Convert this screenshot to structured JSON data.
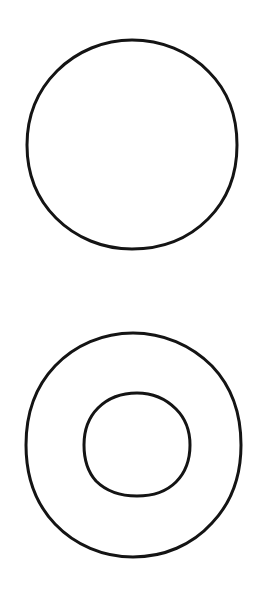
{
  "figure": {
    "kind": "line-drawing",
    "background_color": "#ffffff",
    "ink_color": "#141414",
    "canvas": {
      "width": 268,
      "height": 592
    },
    "shapes": [
      {
        "id": "top-circle",
        "name": "circle",
        "description": "Single hand-drawn circle outline, upper half of the page",
        "center_x": 132,
        "center_y": 145,
        "radius_x": 105,
        "radius_y": 105,
        "bounds": {
          "left": 27,
          "top": 40,
          "right": 237,
          "bottom": 249
        },
        "stroke_width": 3.0,
        "filled": false,
        "path": "M 132 40 C 161 40 189 51 209 72 C 229 92 237 117 237 145 C 237 173 228 199 208 219 C 188 239 161 249 132 249 C 103 249 76 238 56 218 C 36 198 27 172 27 145 C 27 117 37 91 57 71 C 77 51 104 40 132 40 Z"
      },
      {
        "id": "annulus-outer-circle",
        "name": "outer-circle",
        "description": "Outer hand-drawn circle of the annulus, lower half of the page",
        "center_x": 133,
        "center_y": 445,
        "radius_x": 107,
        "radius_y": 112,
        "bounds": {
          "left": 26,
          "top": 333,
          "right": 241,
          "bottom": 557
        },
        "stroke_width": 3.0,
        "filled": false,
        "path": "M 133 333 C 163 333 191 345 212 366 C 232 387 241 414 241 445 C 241 475 232 502 212 523 C 192 545 164 557 133 557 C 103 557 75 545 55 524 C 35 503 26 476 26 445 C 26 414 35 387 55 366 C 75 345 103 333 133 333 Z"
      },
      {
        "id": "annulus-inner-circle",
        "name": "inner-circle",
        "description": "Inner hand-drawn circle forming the hole of the annulus",
        "center_x": 137,
        "center_y": 445,
        "radius_x": 53,
        "radius_y": 52,
        "bounds": {
          "left": 84,
          "top": 393,
          "right": 190,
          "bottom": 496
        },
        "stroke_width": 3.0,
        "filled": false,
        "path": "M 137 393 C 152 393 166 399 176 409 C 186 419 190 431 190 445 C 190 459 186 472 176 482 C 166 492 152 496 137 496 C 121 496 106 491 96 481 C 87 471 84 459 84 445 C 84 430 88 418 98 408 C 108 398 122 393 137 393 Z"
      }
    ],
    "shape_count": 3,
    "labels": [],
    "annotations": []
  }
}
